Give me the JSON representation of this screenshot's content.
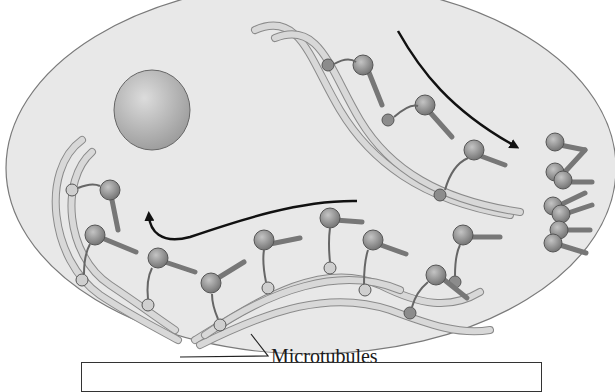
{
  "figure": {
    "labels": {
      "microtubules": "Microtubules"
    },
    "colors": {
      "cell_fill": "#e6e6e6",
      "cell_outline": "#7a7a7a",
      "microtubule_fill": "#d6d6d6",
      "motor_head": "#8f8f8f",
      "motor_light": "#cfcfcf",
      "vesicle": "#b5b5b5",
      "arrow": "#111111"
    },
    "arrows": [
      {
        "name": "transport-arrow-left",
        "direction": "toward vesicle (up-left)"
      },
      {
        "name": "transport-arrow-right",
        "direction": "toward cluster (down-right)"
      }
    ],
    "answer_box": {
      "text": ""
    }
  }
}
